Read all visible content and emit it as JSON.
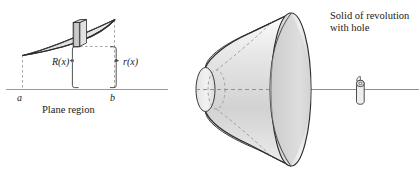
{
  "figure": {
    "kind": "calculus-washer-method-diagram",
    "left_panel": {
      "caption": "Plane region",
      "axis_labels": {
        "left_bound": "a",
        "right_bound": "b"
      },
      "radius_labels": {
        "outer": "R(x)",
        "inner": "r(x)"
      }
    },
    "right_panel": {
      "caption_line1": "Solid of revolution",
      "caption_line2": "with hole",
      "caption_full": "Solid of revolution with hole"
    }
  },
  "colors": {
    "outline": "#2b2b2b",
    "axis": "#8d8d8d",
    "fill_light": "#e9e9e9",
    "fill_mid": "#dcdcdc",
    "fill_dark": "#b9b9b9",
    "dashed": "#9a9a9a",
    "text": "#1a1a1a"
  }
}
